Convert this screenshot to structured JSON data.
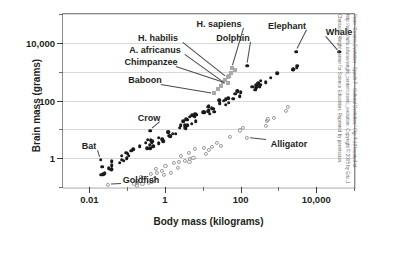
{
  "chart_data": {
    "type": "scatter",
    "title": "",
    "xlabel": "Body mass (kilograms)",
    "ylabel": "Brain mass (grams)",
    "xscale": "log",
    "yscale": "log",
    "xlim": [
      0.002,
      100000
    ],
    "ylim": [
      0.1,
      100000
    ],
    "xticks": [
      "0.01",
      "1",
      "100",
      "10,000"
    ],
    "xtick_values": [
      0.01,
      1,
      100,
      10000
    ],
    "yticks": [
      "10,000",
      "100",
      "1"
    ],
    "ytick_values": [
      10000,
      100,
      1
    ],
    "grid": true,
    "legend": "none",
    "annotations": [
      {
        "label": "H. sapiens",
        "x": 60,
        "y": 1350
      },
      {
        "label": "H. habilis",
        "x": 45,
        "y": 650
      },
      {
        "label": "A. africanus",
        "x": 35,
        "y": 450
      },
      {
        "label": "Chimpanzee",
        "x": 45,
        "y": 400
      },
      {
        "label": "Baboon",
        "x": 20,
        "y": 180
      },
      {
        "label": "Dolphin",
        "x": 150,
        "y": 1600
      },
      {
        "label": "Elephant",
        "x": 3000,
        "y": 5000
      },
      {
        "label": "Whale",
        "x": 40000,
        "y": 5000
      },
      {
        "label": "Crow",
        "x": 0.4,
        "y": 9
      },
      {
        "label": "Bat",
        "x": 0.02,
        "y": 0.9
      },
      {
        "label": "Alligator",
        "x": 150,
        "y": 5
      },
      {
        "label": "Goldfish",
        "x": 0.03,
        "y": 0.12
      }
    ],
    "series": [
      {
        "name": "mammals-and-birds",
        "marker": "filled-circle",
        "color": "#1a1a1a"
      },
      {
        "name": "reptiles-and-fish",
        "marker": "open-circle",
        "color": "#9a9a9a"
      },
      {
        "name": "hominids",
        "marker": "gray-square",
        "color": "#a9a9a9"
      }
    ]
  },
  "credit": {
    "text": "From “Cosmic Evolution - Epoch 7 - Cultural Evolution,” Fig. 7.13 located at http://www.tufts.edu/as/wright_center/cosmic_evolution. Copyright © 2005 by Eric J. Chaisson, Wright Center for Science Education. Reprinted by permission."
  }
}
